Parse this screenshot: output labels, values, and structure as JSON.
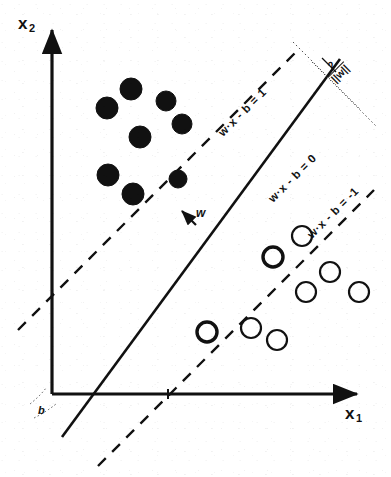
{
  "figure": {
    "background_color": "#ffffff",
    "ink_color": "#111111",
    "width": 391,
    "height": 477
  },
  "axes": {
    "x_label": "x",
    "x_label_sub": "1",
    "y_label": "x",
    "y_label_sub": "2",
    "origin": {
      "x": 52,
      "y": 394
    },
    "x_axis_end": {
      "x": 365,
      "y": 394
    },
    "y_axis_end": {
      "x": 52,
      "y": 22
    }
  },
  "lines": {
    "hyperplane": {
      "label": "w·x - b = 0",
      "style": "solid",
      "rotation_deg": -45
    },
    "margin_positive": {
      "label": "w·x - b = 1",
      "style": "dashed",
      "rotation_deg": -45
    },
    "margin_negative": {
      "label": "w·x - b = -1",
      "style": "dashed",
      "rotation_deg": -45
    }
  },
  "annotations": {
    "margin_numerator": "2",
    "margin_denominator": "||w||",
    "normal_vector": "w",
    "bias": "b"
  },
  "points": {
    "filled_legend": "class +1 (filled circles)",
    "open_legend": "class -1 (open circles)",
    "filled": [
      {
        "x": 131,
        "y": 89,
        "r": 11,
        "support": false
      },
      {
        "x": 107,
        "y": 108,
        "r": 11,
        "support": false
      },
      {
        "x": 166,
        "y": 101,
        "r": 10,
        "support": false
      },
      {
        "x": 182,
        "y": 124,
        "r": 10,
        "support": false
      },
      {
        "x": 140,
        "y": 137,
        "r": 11,
        "support": false
      },
      {
        "x": 108,
        "y": 175,
        "r": 11,
        "support": false
      },
      {
        "x": 133,
        "y": 194,
        "r": 11,
        "support": false
      },
      {
        "x": 178,
        "y": 179,
        "r": 9,
        "support": true
      }
    ],
    "open": [
      {
        "x": 273,
        "y": 257,
        "r": 10,
        "support": true
      },
      {
        "x": 302,
        "y": 236,
        "r": 10,
        "support": false
      },
      {
        "x": 330,
        "y": 272,
        "r": 10,
        "support": false
      },
      {
        "x": 306,
        "y": 292,
        "r": 10,
        "support": false
      },
      {
        "x": 359,
        "y": 292,
        "r": 10,
        "support": false
      },
      {
        "x": 207,
        "y": 332,
        "r": 10,
        "support": true
      },
      {
        "x": 251,
        "y": 328,
        "r": 10,
        "support": false
      },
      {
        "x": 277,
        "y": 340,
        "r": 10,
        "support": false
      }
    ]
  }
}
